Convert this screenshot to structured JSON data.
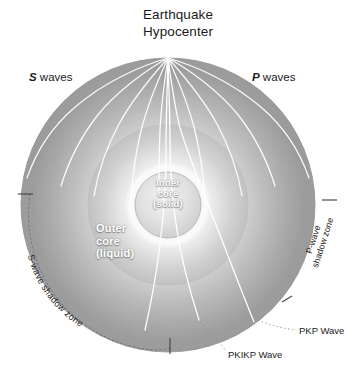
{
  "figure": {
    "title_line1": "Earthquake",
    "title_line2": "Hypocenter",
    "background_color": "#ffffff",
    "ray_color": "#ffffff",
    "text_color": "#1b1b1b"
  },
  "labels": {
    "s_waves_bold": "S",
    "s_waves_rest": " waves",
    "p_waves_bold": "P",
    "p_waves_rest": " waves",
    "inner_core": "Inner core (solid)",
    "inner_core_line1": "Inner",
    "inner_core_line2": "core",
    "inner_core_line3": "(solid)",
    "outer_core_line1": "Outer",
    "outer_core_line2": "core",
    "outer_core_line3": "(liquid)",
    "s_shadow_zone": "S-wave shadow zone",
    "p_shadow_zone_line1": "P-wave",
    "p_shadow_zone_line2": "shadow zone",
    "pkp_wave": "PKP Wave",
    "pkikp_wave": "PKIKP Wave"
  },
  "geometry": {
    "center_x": 168,
    "center_y": 205,
    "earth_radius": 147,
    "outer_core_radius": 80,
    "inner_core_radius": 33,
    "hypocenter_x": 168,
    "hypocenter_y": 58
  },
  "colors": {
    "mantle_light": "#f2f2f2",
    "mantle_mid": "#c9c9c9",
    "mantle_dark": "#9a9a9a",
    "core_light": "#fdfdfd",
    "core_mid": "#d6d6d6",
    "inner_core": "#e8e8e8",
    "outline": "#8a8a8a",
    "shadow_dotted": "#6f6f6f"
  }
}
